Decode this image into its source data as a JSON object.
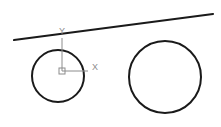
{
  "viewport": {
    "title": "CAD Drawing Viewport",
    "width": 221,
    "height": 127,
    "background_color": "#ffffff"
  },
  "style": {
    "geometry_color": "#1a1a1a",
    "ucs_color": "#8c8c8c",
    "circle_stroke_width": 2,
    "line_stroke_width": 2.2
  },
  "ucs_icon": {
    "name": "UCS icon",
    "origin": {
      "x": 62,
      "y": 71
    },
    "x_axis": {
      "label": "X",
      "label_pos": {
        "x": 95,
        "y": 68
      },
      "end": {
        "x": 88,
        "y": 71
      }
    },
    "y_axis": {
      "label": "Y",
      "label_pos": {
        "x": 62,
        "y": 32
      },
      "end": {
        "x": 62,
        "y": 38
      }
    },
    "origin_box": {
      "x": 59,
      "y": 68,
      "size": 6
    }
  },
  "entities": [
    {
      "type": "line",
      "name": "slanted-line",
      "x1": 14,
      "y1": 40,
      "x2": 213,
      "y2": 14,
      "stroke_width": 2.2
    },
    {
      "type": "circle",
      "name": "left-circle",
      "cx": 58,
      "cy": 76,
      "r": 26,
      "stroke_width": 2
    },
    {
      "type": "circle",
      "name": "right-circle",
      "cx": 165,
      "cy": 77,
      "r": 36,
      "stroke_width": 2
    }
  ],
  "entity_labels": {
    "line": "Line",
    "left_circle": "Circle 1",
    "right_circle": "Circle 2"
  }
}
